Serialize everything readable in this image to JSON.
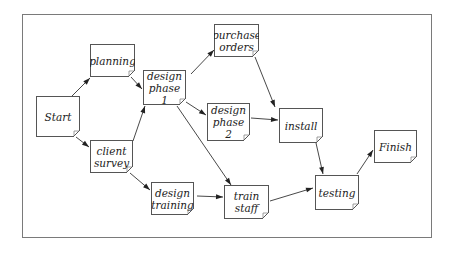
{
  "diagram": {
    "type": "activity-network",
    "nodes": [
      {
        "id": "start",
        "label": "Start",
        "x": 36,
        "y": 96,
        "w": 44,
        "h": 41
      },
      {
        "id": "planning",
        "label": "planning",
        "x": 90,
        "y": 44,
        "w": 45,
        "h": 33
      },
      {
        "id": "client_survey",
        "label": "client survey",
        "x": 90,
        "y": 140,
        "w": 43,
        "h": 33
      },
      {
        "id": "design_phase_1",
        "label": "design phase 1",
        "x": 143,
        "y": 70,
        "w": 43,
        "h": 35
      },
      {
        "id": "purchase_orders",
        "label": "purchase orders",
        "x": 214,
        "y": 24,
        "w": 45,
        "h": 33
      },
      {
        "id": "design_phase_2",
        "label": "design phase 2",
        "x": 207,
        "y": 103,
        "w": 43,
        "h": 38
      },
      {
        "id": "design_training",
        "label": "design training",
        "x": 151,
        "y": 182,
        "w": 43,
        "h": 33
      },
      {
        "id": "install",
        "label": "install",
        "x": 279,
        "y": 108,
        "w": 44,
        "h": 35
      },
      {
        "id": "train_staff",
        "label": "train staff",
        "x": 224,
        "y": 185,
        "w": 45,
        "h": 34
      },
      {
        "id": "testing",
        "label": "testing",
        "x": 315,
        "y": 175,
        "w": 44,
        "h": 35
      },
      {
        "id": "finish",
        "label": "Finish",
        "x": 374,
        "y": 130,
        "w": 43,
        "h": 33
      }
    ],
    "edges": [
      {
        "from": "start",
        "to": "planning",
        "x1": 72,
        "y1": 96,
        "x2": 90,
        "y2": 78
      },
      {
        "from": "start",
        "to": "client_survey",
        "x1": 76,
        "y1": 137,
        "x2": 89,
        "y2": 147
      },
      {
        "from": "planning",
        "to": "design_phase_1",
        "x1": 131,
        "y1": 77,
        "x2": 142,
        "y2": 89
      },
      {
        "from": "client_survey",
        "to": "design_phase_1",
        "x1": 133,
        "y1": 141,
        "x2": 145,
        "y2": 106
      },
      {
        "from": "client_survey",
        "to": "design_training",
        "x1": 130,
        "y1": 173,
        "x2": 150,
        "y2": 190
      },
      {
        "from": "design_phase_1",
        "to": "purchase_orders",
        "x1": 191,
        "y1": 74,
        "x2": 214,
        "y2": 50
      },
      {
        "from": "design_phase_1",
        "to": "design_phase_2",
        "x1": 186,
        "y1": 102,
        "x2": 206,
        "y2": 115
      },
      {
        "from": "design_phase_1",
        "to": "train_staff",
        "x1": 177,
        "y1": 106,
        "x2": 231,
        "y2": 185
      },
      {
        "from": "purchase_orders",
        "to": "install",
        "x1": 255,
        "y1": 57,
        "x2": 275,
        "y2": 107
      },
      {
        "from": "design_phase_2",
        "to": "install",
        "x1": 251,
        "y1": 118,
        "x2": 278,
        "y2": 120
      },
      {
        "from": "design_training",
        "to": "train_staff",
        "x1": 197,
        "y1": 196,
        "x2": 223,
        "y2": 197
      },
      {
        "from": "install",
        "to": "testing",
        "x1": 316,
        "y1": 143,
        "x2": 323,
        "y2": 174
      },
      {
        "from": "train_staff",
        "to": "testing",
        "x1": 270,
        "y1": 201,
        "x2": 313,
        "y2": 188
      },
      {
        "from": "testing",
        "to": "finish",
        "x1": 357,
        "y1": 174,
        "x2": 373,
        "y2": 150
      }
    ],
    "colors": {
      "border": "#555555",
      "frame": "#7a7a7a",
      "edge": "#333333",
      "text": "#222222",
      "background": "#ffffff"
    }
  }
}
